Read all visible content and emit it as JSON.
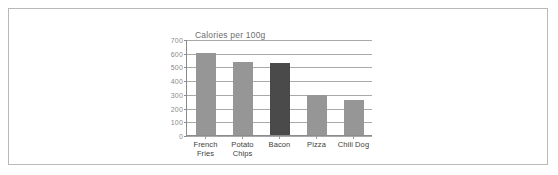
{
  "chart_data": {
    "type": "bar",
    "title": "Calories per 100g",
    "xlabel": "",
    "ylabel": "",
    "ylim": [
      0,
      700
    ],
    "yticks": [
      700,
      600,
      500,
      400,
      300,
      200,
      100,
      0
    ],
    "grid": true,
    "legend": false,
    "categories": [
      "French Fries",
      "Potato Chips",
      "Bacon",
      "Pizza",
      "Chili Dog"
    ],
    "category_lines": [
      [
        "French",
        "Fries"
      ],
      [
        "Potato",
        "Chips"
      ],
      [
        "Bacon",
        ""
      ],
      [
        "Pizza",
        ""
      ],
      [
        "Chili Dog",
        ""
      ]
    ],
    "values": [
      605,
      540,
      530,
      295,
      255
    ],
    "bar_colors": [
      "#969696",
      "#969696",
      "#4a4a4a",
      "#969696",
      "#969696"
    ],
    "highlighted_category": "Bacon",
    "colors": {
      "bar_default": "#969696",
      "bar_highlight": "#4a4a4a",
      "gridline": "#a9a9a9",
      "axis": "#8c8c8c",
      "tick_label": "#8a8a8a",
      "category_label": "#3c3c3c",
      "title": "#6e6e6e",
      "page_border": "#b8b8b8",
      "background": "#ffffff"
    }
  }
}
